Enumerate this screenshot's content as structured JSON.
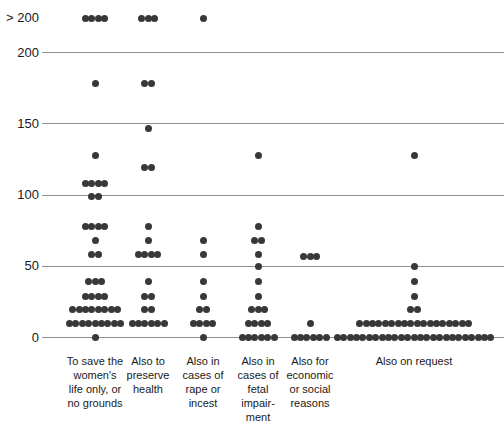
{
  "chart_data": {
    "type": "scatter",
    "title": "",
    "xlabel": "",
    "ylabel": "",
    "style": {
      "dot_color": "#383838",
      "grid_color": "#8f8f8f",
      "text_color": "#1a1a1a",
      "background": "#ffffff"
    },
    "layout": {
      "y_zero": 337.5,
      "px_per_unit": 1.425,
      "overflow_y": 18,
      "grid_left": 42,
      "dot_size": 7,
      "dot_spacing": 6.4,
      "label_top": 354,
      "ylim": [
        0,
        200
      ],
      "grid": true
    },
    "y_axis": {
      "ticks": [
        {
          "label": "> 200",
          "v": ">200"
        },
        {
          "label": "200",
          "v": 200
        },
        {
          "label": "150",
          "v": 150
        },
        {
          "label": "100",
          "v": 100
        },
        {
          "label": "50",
          "v": 50
        },
        {
          "label": "0",
          "v": 0
        }
      ]
    },
    "columns": [
      {
        "label": "To save the women's life only, or no grounds",
        "label_lines": [
          "To save the",
          "women's",
          "life only, or",
          "no grounds"
        ],
        "center_x": 95,
        "label_width": 82,
        "points": [
          {
            "v": ">200",
            "n": 4
          },
          {
            "v": 178,
            "n": 1
          },
          {
            "v": 128,
            "n": 1
          },
          {
            "v": 108,
            "n": 4
          },
          {
            "v": 99,
            "n": 2
          },
          {
            "v": 78,
            "n": 4
          },
          {
            "v": 68,
            "n": 1
          },
          {
            "v": 58,
            "n": 2
          },
          {
            "v": 39,
            "n": 3
          },
          {
            "v": 29,
            "n": 4
          },
          {
            "v": 20,
            "n": 8
          },
          {
            "v": 10,
            "n": 9
          },
          {
            "v": 0,
            "n": 1
          }
        ]
      },
      {
        "label": "Also to preserve health",
        "label_lines": [
          "Also to",
          "preserve",
          "health"
        ],
        "center_x": 148,
        "label_width": 70,
        "points": [
          {
            "v": ">200",
            "n": 3
          },
          {
            "v": 178,
            "n": 2
          },
          {
            "v": 147,
            "n": 1
          },
          {
            "v": 119,
            "n": 2
          },
          {
            "v": 78,
            "n": 1
          },
          {
            "v": 68,
            "n": 1
          },
          {
            "v": 58,
            "n": 4
          },
          {
            "v": 39,
            "n": 1
          },
          {
            "v": 29,
            "n": 2
          },
          {
            "v": 20,
            "n": 2
          },
          {
            "v": 10,
            "n": 6
          }
        ]
      },
      {
        "label": "Also in cases of rape or incest",
        "label_lines": [
          "Also in",
          "cases of",
          "rape or",
          "incest"
        ],
        "center_x": 203,
        "label_width": 70,
        "points": [
          {
            "v": ">200",
            "n": 1
          },
          {
            "v": 68,
            "n": 1
          },
          {
            "v": 58,
            "n": 1
          },
          {
            "v": 39,
            "n": 1
          },
          {
            "v": 29,
            "n": 1
          },
          {
            "v": 20,
            "n": 2
          },
          {
            "v": 10,
            "n": 4
          },
          {
            "v": 0,
            "n": 1
          }
        ]
      },
      {
        "label": "Also in cases of fetal impairment",
        "label_lines": [
          "Also in",
          "cases of",
          "fetal",
          "impair-",
          "ment"
        ],
        "center_x": 258,
        "label_width": 70,
        "points": [
          {
            "v": 128,
            "n": 1
          },
          {
            "v": 78,
            "n": 1
          },
          {
            "v": 68,
            "n": 2
          },
          {
            "v": 58,
            "n": 1
          },
          {
            "v": 50,
            "n": 1
          },
          {
            "v": 39,
            "n": 1
          },
          {
            "v": 29,
            "n": 1
          },
          {
            "v": 20,
            "n": 3
          },
          {
            "v": 10,
            "n": 4
          },
          {
            "v": 0,
            "n": 6
          }
        ]
      },
      {
        "label": "Also for economic or social reasons",
        "label_lines": [
          "Also for",
          "economic",
          "or social",
          "reasons"
        ],
        "center_x": 310,
        "label_width": 80,
        "points": [
          {
            "v": 57,
            "n": 3
          },
          {
            "v": 10,
            "n": 1
          },
          {
            "v": 0,
            "n": 6
          }
        ]
      },
      {
        "label": "Also on request",
        "label_lines": [
          "Also on request"
        ],
        "center_x": 414,
        "label_width": 140,
        "points": [
          {
            "v": 128,
            "n": 1
          },
          {
            "v": 50,
            "n": 1
          },
          {
            "v": 39,
            "n": 1
          },
          {
            "v": 29,
            "n": 1
          },
          {
            "v": 20,
            "n": 2
          },
          {
            "v": 10,
            "n": 18
          },
          {
            "v": 0,
            "n": 25
          }
        ]
      }
    ]
  }
}
